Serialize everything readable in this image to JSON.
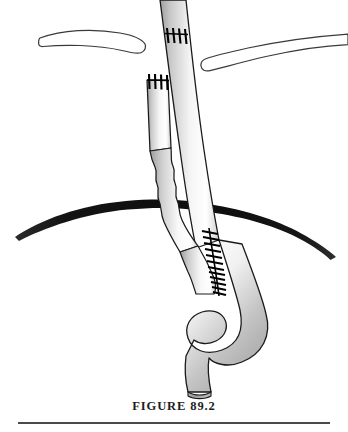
{
  "figure": {
    "caption": "FIGURE 89.2",
    "domain_subject": "surgical anatomic illustration",
    "background_color": "#ffffff",
    "rule_color": "#4a4a4a",
    "caption_color": "#1e1e1e"
  },
  "palette": {
    "outline": "#1a1a1a",
    "vessel_shadow": "#a8a8a8",
    "vessel_mid": "#d0d0d0",
    "vessel_highlight": "#ffffff",
    "suture_color": "#000000",
    "band_color": "#111111",
    "bone_fill": "#ffffff",
    "bone_outline": "#3a3a3a"
  },
  "structures": {
    "main_vessel": {
      "label": "main-vessel-graft",
      "note": "long tube entering top of frame, descending and curving into an S-shaped sigmoid loop, ending in a cut bevel at lower center"
    },
    "side_vessel": {
      "label": "side-vessel-stump",
      "note": "shorter narrower tube at left with an irregular beaded mid-segment, joining the main vessel"
    },
    "left_clavicle": {
      "label": "left-clavicle",
      "note": "thin curved outlined bone at upper left with rounded medial end"
    },
    "right_clavicle": {
      "label": "right-clavicle",
      "note": "thin curved outlined bone at upper right with rounded medial end"
    },
    "dark_band": {
      "label": "dark-tissue-band",
      "note": "thick dark arcing band crossing full width behind the vessels, tapering to points at both ends"
    }
  },
  "suture_groups": [
    {
      "label": "top-anastomosis-sutures",
      "count": 4,
      "location": "main vessel near top of frame"
    },
    {
      "label": "stump-end-sutures",
      "count": 4,
      "location": "upper cut end of side vessel stump"
    },
    {
      "label": "graft-anastomosis-suture-line",
      "count": 14,
      "location": "running suture line along the junction of side vessel and main vessel below the dark band"
    }
  ]
}
